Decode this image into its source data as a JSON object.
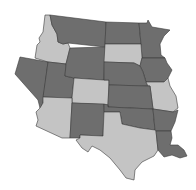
{
  "map": {
    "title": "",
    "colors": {
      "dark": "#6e6e6e",
      "light": "#c4c4c4",
      "border": "#3a3a3a",
      "background": "#ffffff"
    },
    "states": [
      {
        "id": "ID",
        "name": "Idaho",
        "fill": "light"
      },
      {
        "id": "MT",
        "name": "Montana",
        "fill": "dark"
      },
      {
        "id": "ND",
        "name": "North Dakota",
        "fill": "dark"
      },
      {
        "id": "MN",
        "name": "Minnesota",
        "fill": "dark"
      },
      {
        "id": "NV",
        "name": "Nevada",
        "fill": "dark"
      },
      {
        "id": "UT",
        "name": "Utah",
        "fill": "dark"
      },
      {
        "id": "WY",
        "name": "Wyoming",
        "fill": "dark"
      },
      {
        "id": "SD",
        "name": "South Dakota",
        "fill": "light"
      },
      {
        "id": "IA",
        "name": "Iowa",
        "fill": "dark"
      },
      {
        "id": "CO",
        "name": "Colorado",
        "fill": "light"
      },
      {
        "id": "NE",
        "name": "Nebraska",
        "fill": "dark"
      },
      {
        "id": "MO",
        "name": "Missouri",
        "fill": "light"
      },
      {
        "id": "AZ",
        "name": "Arizona",
        "fill": "light"
      },
      {
        "id": "NM",
        "name": "New Mexico",
        "fill": "dark"
      },
      {
        "id": "KS",
        "name": "Kansas",
        "fill": "dark"
      },
      {
        "id": "OK",
        "name": "Oklahoma",
        "fill": "dark"
      },
      {
        "id": "AR",
        "name": "Arkansas",
        "fill": "dark"
      },
      {
        "id": "TX",
        "name": "Texas",
        "fill": "light"
      },
      {
        "id": "LA",
        "name": "Louisiana",
        "fill": "dark"
      }
    ]
  }
}
